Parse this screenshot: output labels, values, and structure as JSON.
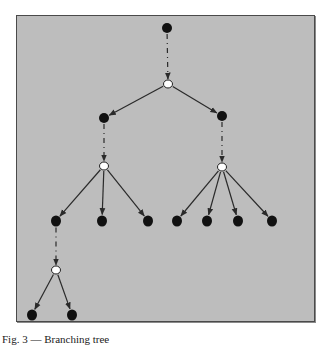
{
  "figure": {
    "background": "#bdbdbd",
    "border_color": "#4a4a4a",
    "node_fill": "#111111",
    "open_node_fill": "#ffffff",
    "edge_color": "#2a2a2a",
    "caption": "Fig. 3 — Branching tree"
  },
  "nodes": [
    {
      "id": "root",
      "x": 167,
      "y": 28,
      "type": "filled",
      "rx": 5,
      "ry": 5
    },
    {
      "id": "b1",
      "x": 168,
      "y": 84,
      "type": "open",
      "rx": 4.5,
      "ry": 4
    },
    {
      "id": "l1",
      "x": 104,
      "y": 118,
      "type": "filled",
      "rx": 5,
      "ry": 5
    },
    {
      "id": "r1",
      "x": 222,
      "y": 116,
      "type": "filled",
      "rx": 5,
      "ry": 5
    },
    {
      "id": "bL",
      "x": 104,
      "y": 166,
      "type": "open",
      "rx": 4.5,
      "ry": 4
    },
    {
      "id": "bR",
      "x": 222,
      "y": 167,
      "type": "open",
      "rx": 4.5,
      "ry": 4
    },
    {
      "id": "lL1",
      "x": 56,
      "y": 221,
      "type": "filled",
      "rx": 5,
      "ry": 5.5
    },
    {
      "id": "lL2",
      "x": 102,
      "y": 221,
      "type": "filled",
      "rx": 5,
      "ry": 5.5
    },
    {
      "id": "lL3",
      "x": 148,
      "y": 221,
      "type": "filled",
      "rx": 5,
      "ry": 5.5
    },
    {
      "id": "lR1",
      "x": 177,
      "y": 221,
      "type": "filled",
      "rx": 5,
      "ry": 5.5
    },
    {
      "id": "lR2",
      "x": 207,
      "y": 221,
      "type": "filled",
      "rx": 5,
      "ry": 5.5
    },
    {
      "id": "lR3",
      "x": 238,
      "y": 221,
      "type": "filled",
      "rx": 5,
      "ry": 5.5
    },
    {
      "id": "lR4",
      "x": 272,
      "y": 221,
      "type": "filled",
      "rx": 5,
      "ry": 5.5
    },
    {
      "id": "b3",
      "x": 56,
      "y": 270,
      "type": "open",
      "rx": 4.5,
      "ry": 4
    },
    {
      "id": "leaf1",
      "x": 32,
      "y": 315,
      "type": "filled",
      "rx": 5,
      "ry": 5.5
    },
    {
      "id": "leaf2",
      "x": 72,
      "y": 315,
      "type": "filled",
      "rx": 5,
      "ry": 5.5
    }
  ],
  "edges": [
    {
      "from": "root",
      "to": "b1",
      "style": "dashed"
    },
    {
      "from": "b1",
      "to": "l1",
      "style": "solid"
    },
    {
      "from": "b1",
      "to": "r1",
      "style": "solid"
    },
    {
      "from": "l1",
      "to": "bL",
      "style": "dashed"
    },
    {
      "from": "r1",
      "to": "bR",
      "style": "dashed"
    },
    {
      "from": "bL",
      "to": "lL1",
      "style": "solid"
    },
    {
      "from": "bL",
      "to": "lL2",
      "style": "solid"
    },
    {
      "from": "bL",
      "to": "lL3",
      "style": "solid"
    },
    {
      "from": "bR",
      "to": "lR1",
      "style": "solid"
    },
    {
      "from": "bR",
      "to": "lR2",
      "style": "solid"
    },
    {
      "from": "bR",
      "to": "lR3",
      "style": "solid"
    },
    {
      "from": "bR",
      "to": "lR4",
      "style": "solid"
    },
    {
      "from": "lL1",
      "to": "b3",
      "style": "dashed"
    },
    {
      "from": "b3",
      "to": "leaf1",
      "style": "solid"
    },
    {
      "from": "b3",
      "to": "leaf2",
      "style": "solid"
    }
  ]
}
